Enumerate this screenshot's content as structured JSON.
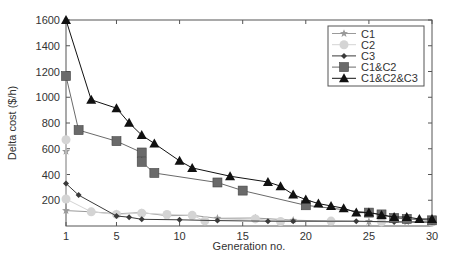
{
  "chart_data": {
    "type": "line",
    "title": "",
    "xlabel": "Generation no.",
    "ylabel": "Delta cost ($/h)",
    "xlim": [
      1,
      30
    ],
    "ylim": [
      0,
      1600
    ],
    "xticks": [
      1,
      5,
      10,
      15,
      20,
      25,
      30
    ],
    "yticks": [
      200,
      400,
      600,
      800,
      1000,
      1200,
      1400,
      1600
    ],
    "grid": false,
    "legend_position": "upper right",
    "series": [
      {
        "name": "C1",
        "marker": "star",
        "color": "#9a9a9a",
        "x": [
          1,
          1,
          3,
          5,
          7,
          9,
          11,
          13,
          16,
          19,
          22,
          25,
          28,
          30
        ],
        "y": [
          580,
          120,
          110,
          95,
          104,
          80,
          83,
          60,
          62,
          45,
          38,
          35,
          32,
          30
        ]
      },
      {
        "name": "C2",
        "marker": "circle",
        "color": "#d4d4d4",
        "x": [
          1,
          1,
          3,
          5,
          7,
          9,
          11,
          12,
          16,
          18,
          22,
          26,
          30
        ],
        "y": [
          670,
          210,
          110,
          90,
          100,
          90,
          83,
          40,
          55,
          35,
          38,
          32,
          30
        ]
      },
      {
        "name": "C3",
        "marker": "diamond",
        "color": "#3a3a3a",
        "x": [
          1,
          2,
          5,
          6,
          7,
          10,
          13,
          17,
          19,
          24,
          27,
          30
        ],
        "y": [
          330,
          240,
          78,
          68,
          52,
          48,
          42,
          37,
          37,
          37,
          32,
          30
        ]
      },
      {
        "name": "C1&C2",
        "marker": "square",
        "color": "#6a6a6a",
        "x": [
          1,
          2,
          5,
          7,
          7,
          8,
          13,
          15,
          20,
          25,
          26,
          27,
          28,
          30
        ],
        "y": [
          1165,
          745,
          659,
          571,
          498,
          412,
          338,
          275,
          161,
          104,
          90,
          62,
          55,
          44
        ]
      },
      {
        "name": "C1&C2&C3",
        "marker": "triangle",
        "color": "#111111",
        "x": [
          1,
          3,
          5,
          6,
          7,
          8,
          10,
          11,
          14,
          17,
          18,
          19,
          20,
          21,
          22,
          23,
          24,
          25,
          26,
          27,
          28,
          29,
          30
        ],
        "y": [
          1600,
          980,
          915,
          801,
          706,
          641,
          506,
          451,
          387,
          342,
          309,
          244,
          205,
          174,
          156,
          138,
          104,
          104,
          86,
          70,
          70,
          54,
          54
        ]
      }
    ]
  }
}
